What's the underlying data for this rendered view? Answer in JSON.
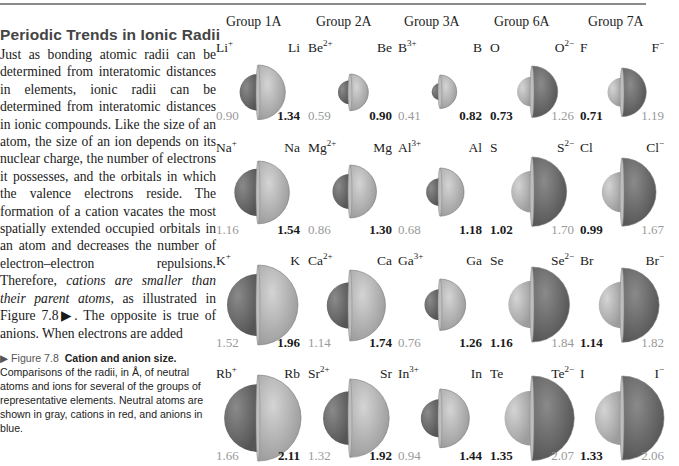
{
  "text": {
    "section_title": "Periodic Trends in Ionic Radii",
    "paragraph_parts": [
      "Just as bonding atomic radii can be determined from interatomic dis­tances in elements, ionic radii can be determined from interatomic dis­tances in ionic compounds. Like the size of an atom, the size of an ion depends on its nuclear charge, the number of electrons it possesses, and the orbitals in which the va­lence electrons reside. The forma­tion of a cation vacates the most spatially extended occupied orbitals in an atom and decreases the num­ber of electron–electron repulsions. Therefore, ",
      "cations are smaller than their parent atoms",
      ", as illustrated in Figure 7.8▶. The opposite is true of anions. When electrons are added"
    ]
  },
  "caption": {
    "figure_label": "▶ Figure 7.8",
    "figure_title": "Cation and anion size.",
    "body": "Comparisons of the radii, in Å, of neutral atoms and ions for several of the groups of representative elements. Neutral atoms are shown in gray, cations in red, and anions in blue."
  },
  "figure": {
    "groups": [
      {
        "name": "Group 1A",
        "rows": [
          {
            "left": {
              "sym": "Li",
              "sup": "+",
              "val": "0.90",
              "kind": "cation"
            },
            "right": {
              "sym": "Li",
              "sup": "",
              "val": "1.34",
              "kind": "atom"
            }
          },
          {
            "left": {
              "sym": "Na",
              "sup": "+",
              "val": "1.16",
              "kind": "cation"
            },
            "right": {
              "sym": "Na",
              "sup": "",
              "val": "1.54",
              "kind": "atom"
            }
          },
          {
            "left": {
              "sym": "K",
              "sup": "+",
              "val": "1.52",
              "kind": "cation"
            },
            "right": {
              "sym": "K",
              "sup": "",
              "val": "1.96",
              "kind": "atom"
            }
          },
          {
            "left": {
              "sym": "Rb",
              "sup": "+",
              "val": "1.66",
              "kind": "cation"
            },
            "right": {
              "sym": "Rb",
              "sup": "",
              "val": "2.11",
              "kind": "atom"
            }
          }
        ]
      },
      {
        "name": "Group 2A",
        "rows": [
          {
            "left": {
              "sym": "Be",
              "sup": "2+",
              "val": "0.59",
              "kind": "cation"
            },
            "right": {
              "sym": "Be",
              "sup": "",
              "val": "0.90",
              "kind": "atom"
            }
          },
          {
            "left": {
              "sym": "Mg",
              "sup": "2+",
              "val": "0.86",
              "kind": "cation"
            },
            "right": {
              "sym": "Mg",
              "sup": "",
              "val": "1.30",
              "kind": "atom"
            }
          },
          {
            "left": {
              "sym": "Ca",
              "sup": "2+",
              "val": "1.14",
              "kind": "cation"
            },
            "right": {
              "sym": "Ca",
              "sup": "",
              "val": "1.74",
              "kind": "atom"
            }
          },
          {
            "left": {
              "sym": "Sr",
              "sup": "2+",
              "val": "1.32",
              "kind": "cation"
            },
            "right": {
              "sym": "Sr",
              "sup": "",
              "val": "1.92",
              "kind": "atom"
            }
          }
        ]
      },
      {
        "name": "Group 3A",
        "rows": [
          {
            "left": {
              "sym": "B",
              "sup": "3+",
              "val": "0.41",
              "kind": "cation"
            },
            "right": {
              "sym": "B",
              "sup": "",
              "val": "0.82",
              "kind": "atom"
            }
          },
          {
            "left": {
              "sym": "Al",
              "sup": "3+",
              "val": "0.68",
              "kind": "cation"
            },
            "right": {
              "sym": "Al",
              "sup": "",
              "val": "1.18",
              "kind": "atom"
            }
          },
          {
            "left": {
              "sym": "Ga",
              "sup": "3+",
              "val": "0.76",
              "kind": "cation"
            },
            "right": {
              "sym": "Ga",
              "sup": "",
              "val": "1.26",
              "kind": "atom"
            }
          },
          {
            "left": {
              "sym": "In",
              "sup": "3+",
              "val": "0.94",
              "kind": "cation"
            },
            "right": {
              "sym": "In",
              "sup": "",
              "val": "1.44",
              "kind": "atom"
            }
          }
        ]
      },
      {
        "name": "Group 6A",
        "rows": [
          {
            "left": {
              "sym": "O",
              "sup": "",
              "val": "0.73",
              "kind": "atom"
            },
            "right": {
              "sym": "O",
              "sup": "2−",
              "val": "1.26",
              "kind": "anion"
            }
          },
          {
            "left": {
              "sym": "S",
              "sup": "",
              "val": "1.02",
              "kind": "atom"
            },
            "right": {
              "sym": "S",
              "sup": "2−",
              "val": "1.70",
              "kind": "anion"
            }
          },
          {
            "left": {
              "sym": "Se",
              "sup": "",
              "val": "1.16",
              "kind": "atom"
            },
            "right": {
              "sym": "Se",
              "sup": "2−",
              "val": "1.84",
              "kind": "anion"
            }
          },
          {
            "left": {
              "sym": "Te",
              "sup": "",
              "val": "1.35",
              "kind": "atom"
            },
            "right": {
              "sym": "Te",
              "sup": "2−",
              "val": "2.07",
              "kind": "anion"
            }
          }
        ]
      },
      {
        "name": "Group 7A",
        "rows": [
          {
            "left": {
              "sym": "F",
              "sup": "",
              "val": "0.71",
              "kind": "atom"
            },
            "right": {
              "sym": "F",
              "sup": "−",
              "val": "1.19",
              "kind": "anion"
            }
          },
          {
            "left": {
              "sym": "Cl",
              "sup": "",
              "val": "0.99",
              "kind": "atom"
            },
            "right": {
              "sym": "Cl",
              "sup": "−",
              "val": "1.67",
              "kind": "anion"
            }
          },
          {
            "left": {
              "sym": "Br",
              "sup": "",
              "val": "1.14",
              "kind": "atom"
            },
            "right": {
              "sym": "Br",
              "sup": "−",
              "val": "1.82",
              "kind": "anion"
            }
          },
          {
            "left": {
              "sym": "I",
              "sup": "",
              "val": "1.33",
              "kind": "atom"
            },
            "right": {
              "sym": "I",
              "sup": "−",
              "val": "2.06",
              "kind": "anion"
            }
          }
        ]
      }
    ],
    "colors": {
      "atom_fill": "#d4d4d4",
      "atom_shade": "#9c9c9c",
      "ion_fill": "#8a8a8a",
      "ion_shade": "#555555"
    }
  }
}
